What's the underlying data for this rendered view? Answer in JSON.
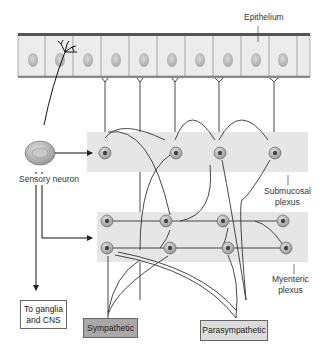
{
  "diagram": {
    "type": "enteric-nervous-system-schematic",
    "labels": {
      "epithelium": "Epithelium",
      "sensory_neuron": "Sensory neuron",
      "submucosal_line1": "Submucosal",
      "submucosal_line2": "plexus",
      "myenteric_line1": "Myenteric",
      "myenteric_line2": "plexus"
    },
    "boxes": {
      "ganglia_line1": "To ganglia",
      "ganglia_line2": "and CNS",
      "sympathetic": "Sympathetic",
      "parasympathetic": "Parasympathetic"
    },
    "colors": {
      "band": "#e6e6e6",
      "epithelium_cell": "#ebebeb",
      "nucleus": "#c2c2c2",
      "neuron_body": "#b8b8b8",
      "neuron_nucleus": "#444444",
      "line": "#333333",
      "sympathetic_box": "#a9a9a9",
      "parasympathetic_box": "#dcdcdc",
      "ganglia_box": "#ffffff"
    },
    "structure": {
      "epithelium_cells": 11,
      "submucosal_neurons": 4,
      "myenteric_neurons": 8
    }
  }
}
